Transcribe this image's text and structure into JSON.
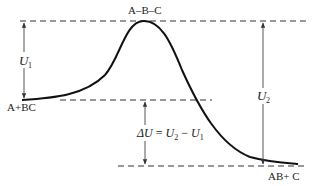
{
  "diagram": {
    "type": "potential-energy-reaction-profile",
    "labels": {
      "transition_state": "A–B–C",
      "reactants": "A+BC",
      "products": "AB+ C",
      "activation_energy_symbol": "U",
      "activation_energy_sub": "1",
      "reverse_energy_symbol": "U",
      "reverse_energy_sub": "2",
      "delta_prefix": "ΔU",
      "delta_equals": " = ",
      "delta_rhs_u2": "U",
      "delta_rhs_u2_sub": "2",
      "delta_minus": " − ",
      "delta_rhs_u1": "U",
      "delta_rhs_u1_sub": "1"
    },
    "levels": {
      "transition_state_y": 21,
      "reactants_y": 100,
      "products_y": 166
    },
    "colors": {
      "curve": "#111111",
      "lines": "#333333",
      "background": "#ffffff"
    }
  }
}
